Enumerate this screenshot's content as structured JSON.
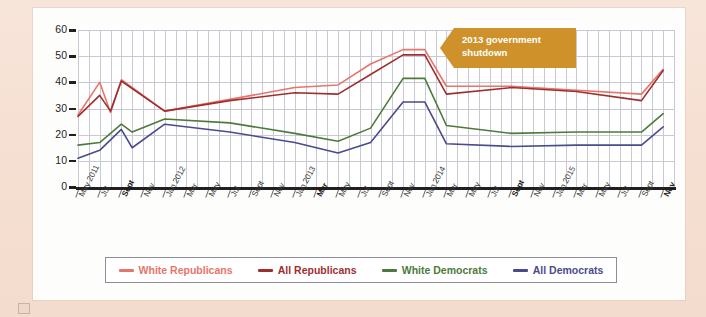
{
  "chart_data": {
    "type": "line",
    "title": "",
    "xlabel": "",
    "ylabel": "Percentage",
    "ylim": [
      0,
      60
    ],
    "yticks": [
      0,
      10,
      20,
      30,
      40,
      50,
      60
    ],
    "grid": true,
    "legend_position": "bottom",
    "annotations": [
      {
        "text_line1": "2013 government",
        "text_line2": "shutdown",
        "color": "#cf922b",
        "points_to": "Oct 2013"
      }
    ],
    "x_tick_labels": [
      {
        "label": "May 2011",
        "bold": false
      },
      {
        "label": "Jul",
        "bold": false
      },
      {
        "label": "Sept",
        "bold": true
      },
      {
        "label": "Nov",
        "bold": false
      },
      {
        "label": "Jan 2012",
        "bold": false
      },
      {
        "label": "Mar",
        "bold": false
      },
      {
        "label": "May",
        "bold": false
      },
      {
        "label": "Jul",
        "bold": false
      },
      {
        "label": "Sept",
        "bold": false
      },
      {
        "label": "Nov",
        "bold": false
      },
      {
        "label": "Jan 2013",
        "bold": false
      },
      {
        "label": "Mar",
        "bold": true
      },
      {
        "label": "May",
        "bold": false
      },
      {
        "label": "Jul",
        "bold": false
      },
      {
        "label": "Sept",
        "bold": false
      },
      {
        "label": "Nov",
        "bold": false
      },
      {
        "label": "Jan 2014",
        "bold": false
      },
      {
        "label": "Mar",
        "bold": false
      },
      {
        "label": "May",
        "bold": false
      },
      {
        "label": "Jul",
        "bold": false
      },
      {
        "label": "Sept",
        "bold": true
      },
      {
        "label": "Nov",
        "bold": false
      },
      {
        "label": "Jan 2015",
        "bold": false
      },
      {
        "label": "Mar",
        "bold": false
      },
      {
        "label": "May",
        "bold": false
      },
      {
        "label": "Jul",
        "bold": false
      },
      {
        "label": "Sept",
        "bold": false
      },
      {
        "label": "Nov",
        "bold": true
      }
    ],
    "x_positions": [
      0,
      2,
      4,
      6,
      8,
      10,
      12,
      14,
      16,
      18,
      20,
      22,
      24,
      26,
      28,
      30,
      32,
      34,
      36,
      38,
      40,
      42,
      44,
      46,
      48,
      50,
      52,
      54
    ],
    "x_total_units": 55,
    "series": [
      {
        "name": "White Republicans",
        "color": "#e8756a",
        "x": [
          0,
          2,
          3,
          4,
          8,
          14,
          20,
          24,
          27,
          30,
          32,
          34,
          40,
          46,
          52,
          54
        ],
        "values": [
          27.5,
          40.0,
          28.5,
          41.0,
          29.0,
          33.5,
          38.0,
          39.0,
          47.0,
          52.5,
          52.5,
          38.5,
          38.5,
          37.0,
          35.5,
          45.0
        ]
      },
      {
        "name": "All Republicans",
        "color": "#9e2f2f",
        "x": [
          0,
          2,
          3,
          4,
          8,
          14,
          20,
          24,
          27,
          30,
          32,
          34,
          40,
          46,
          52,
          54
        ],
        "values": [
          27.0,
          35.0,
          29.0,
          40.5,
          29.0,
          33.0,
          36.0,
          35.5,
          43.0,
          50.5,
          50.5,
          35.5,
          38.0,
          36.5,
          33.0,
          44.5
        ]
      },
      {
        "name": "White Democrats",
        "color": "#4d7a3a",
        "x": [
          0,
          2,
          4,
          5,
          8,
          14,
          20,
          24,
          27,
          30,
          32,
          34,
          40,
          46,
          52,
          54
        ],
        "values": [
          16.0,
          17.0,
          24.0,
          21.0,
          26.0,
          24.5,
          20.5,
          17.5,
          22.5,
          41.5,
          41.5,
          23.5,
          20.5,
          21.0,
          21.0,
          28.0
        ]
      },
      {
        "name": "All Democrats",
        "color": "#4a4a8f",
        "x": [
          0,
          2,
          4,
          5,
          8,
          14,
          20,
          24,
          27,
          30,
          32,
          34,
          40,
          46,
          52,
          54
        ],
        "values": [
          11.0,
          14.0,
          22.0,
          15.0,
          24.0,
          21.0,
          17.0,
          13.0,
          17.0,
          32.5,
          32.5,
          16.5,
          15.5,
          16.0,
          16.0,
          23.0
        ]
      }
    ]
  },
  "legend": {
    "items": [
      {
        "label": "White Republicans",
        "color": "#e8756a"
      },
      {
        "label": "All Republicans",
        "color": "#9e2f2f"
      },
      {
        "label": "White Democrats",
        "color": "#4d7a3a"
      },
      {
        "label": "All Democrats",
        "color": "#4a4a8f"
      }
    ]
  },
  "colors": {
    "page_background": "#f7e2d6",
    "card_background": "#fdfdfc",
    "grid": "#c9c9d6",
    "axis": "#231f20",
    "callout": "#cf922b"
  }
}
